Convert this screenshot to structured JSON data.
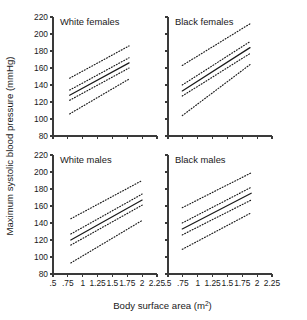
{
  "chart_data": {
    "type": "line",
    "title": "",
    "layout": {
      "rows": 2,
      "cols": 2,
      "grid": false,
      "legend": false,
      "shared_x_axis": true,
      "shared_y_axis": true
    },
    "xlabel": "Body surface area (m",
    "xlabel_sup": "2",
    "xlabel_tail": ")",
    "ylabel": "Maximum systolic blood pressure (mmHg)",
    "xlim": [
      0.5,
      2.25
    ],
    "ylim": [
      80,
      220
    ],
    "xticks": [
      ".5",
      ".75",
      "1",
      "1.25",
      "1.5",
      "1.75",
      "2",
      "2.25"
    ],
    "xtick_values": [
      0.5,
      0.75,
      1,
      1.25,
      1.5,
      1.75,
      2,
      2.25
    ],
    "yticks": [
      "220",
      "200",
      "180",
      "160",
      "140",
      "120",
      "100",
      "80"
    ],
    "ytick_values": [
      220,
      200,
      180,
      160,
      140,
      120,
      100,
      80
    ],
    "series_names": [
      "regression fit",
      "lower confidence limit",
      "upper confidence limit",
      "lower prediction limit",
      "upper prediction limit"
    ],
    "panels": [
      {
        "name": "white-females",
        "title": "White females",
        "row": 0,
        "col": 0,
        "x_range": [
          0.78,
          1.78
        ],
        "fit": {
          "x": [
            0.78,
            1.78
          ],
          "y": [
            128,
            166
          ],
          "style": "solid"
        },
        "ci_lower": {
          "x": [
            0.78,
            1.78
          ],
          "y": [
            122,
            160
          ],
          "style": "dotted"
        },
        "ci_upper": {
          "x": [
            0.78,
            1.78
          ],
          "y": [
            134,
            172
          ],
          "style": "dotted"
        },
        "pi_lower": {
          "x": [
            0.78,
            1.78
          ],
          "y": [
            106,
            147
          ],
          "style": "dotted"
        },
        "pi_upper": {
          "x": [
            0.78,
            1.78
          ],
          "y": [
            148,
            186
          ],
          "style": "dotted"
        }
      },
      {
        "name": "black-females",
        "title": "Black females",
        "row": 0,
        "col": 1,
        "x_range": [
          0.74,
          1.88
        ],
        "fit": {
          "x": [
            0.74,
            1.88
          ],
          "y": [
            133,
            184
          ],
          "style": "solid"
        },
        "ci_lower": {
          "x": [
            0.74,
            1.88
          ],
          "y": [
            127,
            177
          ],
          "style": "dotted"
        },
        "ci_upper": {
          "x": [
            0.74,
            1.88
          ],
          "y": [
            140,
            191
          ],
          "style": "dotted"
        },
        "pi_lower": {
          "x": [
            0.74,
            1.88
          ],
          "y": [
            104,
            164
          ],
          "style": "dotted"
        },
        "pi_upper": {
          "x": [
            0.74,
            1.88
          ],
          "y": [
            163,
            212
          ],
          "style": "dotted"
        }
      },
      {
        "name": "white-males",
        "title": "White males",
        "row": 1,
        "col": 0,
        "x_range": [
          0.8,
          2.0
        ],
        "fit": {
          "x": [
            0.8,
            2.0
          ],
          "y": [
            120,
            167
          ],
          "style": "solid"
        },
        "ci_lower": {
          "x": [
            0.8,
            2.0
          ],
          "y": [
            114,
            161
          ],
          "style": "dotted"
        },
        "ci_upper": {
          "x": [
            0.8,
            2.0
          ],
          "y": [
            127,
            174
          ],
          "style": "dotted"
        },
        "pi_lower": {
          "x": [
            0.8,
            2.0
          ],
          "y": [
            93,
            143
          ],
          "style": "dotted"
        },
        "pi_upper": {
          "x": [
            0.8,
            2.0
          ],
          "y": [
            145,
            190
          ],
          "style": "dotted"
        }
      },
      {
        "name": "black-males",
        "title": "Black males",
        "row": 1,
        "col": 1,
        "x_range": [
          0.74,
          1.9
        ],
        "fit": {
          "x": [
            0.74,
            1.9
          ],
          "y": [
            133,
            175
          ],
          "style": "solid"
        },
        "ci_lower": {
          "x": [
            0.74,
            1.9
          ],
          "y": [
            126,
            167
          ],
          "style": "dotted"
        },
        "ci_upper": {
          "x": [
            0.74,
            1.9
          ],
          "y": [
            140,
            182
          ],
          "style": "dotted"
        },
        "pi_lower": {
          "x": [
            0.74,
            1.9
          ],
          "y": [
            109,
            152
          ],
          "style": "dotted"
        },
        "pi_upper": {
          "x": [
            0.74,
            1.9
          ],
          "y": [
            158,
            199
          ],
          "style": "dotted"
        }
      }
    ]
  }
}
